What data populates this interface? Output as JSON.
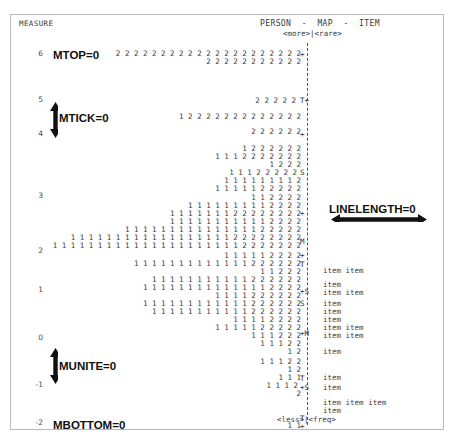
{
  "window": {
    "width": 466,
    "height": 448,
    "background": "#ffffff",
    "border_color": "#b9b9b9"
  },
  "header": {
    "measure_label": "MEASURE",
    "map_title": "PERSON  -  MAP  -  ITEM",
    "top_legend": "<more>|<rare>",
    "bottom_legend": "<less>|<freq>"
  },
  "annotations": [
    {
      "name": "mtop",
      "label": "MTOP=0",
      "x": 42,
      "y": 34,
      "arrow": "none"
    },
    {
      "name": "mtick",
      "label": "MTICK=0",
      "x": 48,
      "y": 97,
      "arrow": "vertical-double"
    },
    {
      "name": "linelength",
      "label": "LINELENGTH=0",
      "x": 318,
      "y": 188,
      "arrow": "horizontal-double"
    },
    {
      "name": "munite",
      "label": "MUNITE=0",
      "x": 48,
      "y": 345,
      "arrow": "vertical-double"
    },
    {
      "name": "mbottom",
      "label": "MBOTTOM=0",
      "x": 42,
      "y": 404,
      "arrow": "none"
    }
  ],
  "arrows": {
    "mtick": {
      "x": 38,
      "y": 87,
      "height": 36,
      "color": "#111111"
    },
    "munite": {
      "x": 38,
      "y": 333,
      "height": 36,
      "color": "#111111"
    },
    "linelength": {
      "x": 320,
      "y": 198,
      "width": 96,
      "color": "#111111"
    }
  },
  "chart_data": {
    "type": "table",
    "title": "PERSON - MAP - ITEM",
    "xlabel": "",
    "ylabel": "MEASURE",
    "ylim": [
      -2,
      6
    ],
    "grid": false,
    "legend": "none",
    "y_axis_ticks": [
      {
        "value": "6",
        "y": 38
      },
      {
        "value": "5",
        "y": 84
      },
      {
        "value": "4",
        "y": 118
      },
      {
        "value": "3",
        "y": 180
      },
      {
        "value": "2",
        "y": 235
      },
      {
        "value": "1",
        "y": 274
      },
      {
        "value": "0",
        "y": 322
      },
      {
        "value": "-1",
        "y": 369
      },
      {
        "value": "-2",
        "y": 407
      }
    ],
    "axis_markers": [
      {
        "text": "+",
        "y": 39
      },
      {
        "text": "T+",
        "y": 85
      },
      {
        "text": "+",
        "y": 119
      },
      {
        "text": "S",
        "y": 157
      },
      {
        "text": "+",
        "y": 198
      },
      {
        "text": "M",
        "y": 226
      },
      {
        "text": "+",
        "y": 240
      },
      {
        "text": "T",
        "y": 249
      },
      {
        "text": "+S",
        "y": 276
      },
      {
        "text": "S",
        "y": 288
      },
      {
        "text": "+M",
        "y": 318
      },
      {
        "text": "T",
        "y": 363
      },
      {
        "text": "+S",
        "y": 372
      },
      {
        "text": "T",
        "y": 403
      },
      {
        "text": "+",
        "y": 411
      }
    ],
    "person_rows": [
      {
        "y": 38,
        "right": 292,
        "cells": "2 2 2 2 2 2 2 2 2 2 2 2 2 2 2 2 2 2 2 2 2"
      },
      {
        "y": 46,
        "right": 292,
        "cells": "2 2 2 2 2 2 2 2 2 2 2"
      },
      {
        "y": 85,
        "right": 287,
        "cells": "2 2 2 2 2"
      },
      {
        "y": 101,
        "right": 292,
        "cells": "1 2 2 2 2 2 2 2 2 2 2 2 2 2"
      },
      {
        "y": 116,
        "right": 292,
        "cells": "2 2 2 2 2 2"
      },
      {
        "y": 133,
        "right": 292,
        "cells": "1 2 2 2 2 2 2"
      },
      {
        "y": 141,
        "right": 292,
        "cells": "1 1 1 2 2 2 2 2 2 2"
      },
      {
        "y": 149,
        "right": 292,
        "cells": "1 2 2 2"
      },
      {
        "y": 157,
        "right": 288,
        "cells": "1 1 1 2 2 2 2 2"
      },
      {
        "y": 165,
        "right": 292,
        "cells": "1 1 1 1 1 1 1 1 2"
      },
      {
        "y": 173,
        "right": 292,
        "cells": "1 1 1 1 1 2 2 2 2 2"
      },
      {
        "y": 182,
        "right": 292,
        "cells": "1 1 2 2 2 2"
      },
      {
        "y": 190,
        "right": 292,
        "cells": "1 1 1 1 1 1 1 1 1 2 2 2 2"
      },
      {
        "y": 198,
        "right": 292,
        "cells": "1 1 1 1 1 1 1 2 2 2 2 2 2 2 2"
      },
      {
        "y": 206,
        "right": 292,
        "cells": "1 1 1 1 1 1 1 1 1 1 1 2 2 2 2"
      },
      {
        "y": 214,
        "right": 292,
        "cells": "1 1 1 1 1 1 1 1 1 1 1 1 1 1 1 2 2 2 2 2"
      },
      {
        "y": 222,
        "right": 292,
        "cells": "1 1 1 1 1 1 1 1 1 1 1 1 1 1 1 1 1 1 2 2 2 2 2 2 2 2"
      },
      {
        "y": 230,
        "right": 292,
        "cells": "1 1 1 1 1 1 1 1 1 1 1 1 1 1 1 1 1 1 1 1 1 2 2 2 2 2 2 2"
      },
      {
        "y": 240,
        "right": 292,
        "cells": "1 1 1 1 1 2 2 2 2"
      },
      {
        "y": 248,
        "right": 292,
        "cells": "1 1 1 1 1 1 1 1 1 1 1 1 1 2 2 2 2 2 2"
      },
      {
        "y": 256,
        "right": 292,
        "cells": "1 1 2 2 2"
      },
      {
        "y": 264,
        "right": 292,
        "cells": "1 1 1 1 1 1 1 1 1 1 1 2 2 2 2 2 2"
      },
      {
        "y": 272,
        "right": 292,
        "cells": "1 1 1 1 1 1 1 1 1 1 1 1 1 1 2 2 2 2"
      },
      {
        "y": 280,
        "right": 292,
        "cells": "1 1 1 1 2 2 2 2 2 2"
      },
      {
        "y": 288,
        "right": 292,
        "cells": "1 1 1 1 1 1 1 1 1 1 1 1 2 2 2 2 2 2"
      },
      {
        "y": 296,
        "right": 292,
        "cells": "1 1 1 1 1 1 1 1 1 1 1 2 2 2 2 2 2"
      },
      {
        "y": 304,
        "right": 292,
        "cells": "1 1 1 1 2 2 2 2"
      },
      {
        "y": 312,
        "right": 292,
        "cells": "1 1 1 1 1 2 2 2 2 2"
      },
      {
        "y": 320,
        "right": 292,
        "cells": "1 1 1 2 2 2"
      },
      {
        "y": 328,
        "right": 292,
        "cells": "1 1 1 2 2"
      },
      {
        "y": 336,
        "right": 292,
        "cells": "1 2"
      },
      {
        "y": 346,
        "right": 292,
        "cells": "1 1 1 2 2"
      },
      {
        "y": 354,
        "right": 292,
        "cells": "1 2"
      },
      {
        "y": 362,
        "right": 292,
        "cells": "1 1 1"
      },
      {
        "y": 370,
        "right": 289,
        "cells": "1 1 1 2"
      },
      {
        "y": 378,
        "right": 292,
        "cells": "2"
      },
      {
        "y": 410,
        "right": 292,
        "cells": "1 1"
      }
    ],
    "item_rows": [
      {
        "y": 255,
        "text": "item item"
      },
      {
        "y": 269,
        "text": "item"
      },
      {
        "y": 277,
        "text": "item item"
      },
      {
        "y": 288,
        "text": "item"
      },
      {
        "y": 296,
        "text": "item"
      },
      {
        "y": 304,
        "text": "item"
      },
      {
        "y": 312,
        "text": "item item"
      },
      {
        "y": 320,
        "text": "item item"
      },
      {
        "y": 336,
        "text": "item"
      },
      {
        "y": 362,
        "text": "item"
      },
      {
        "y": 372,
        "text": "item"
      },
      {
        "y": 387,
        "text": "item item item"
      },
      {
        "y": 395,
        "text": "item"
      }
    ]
  }
}
